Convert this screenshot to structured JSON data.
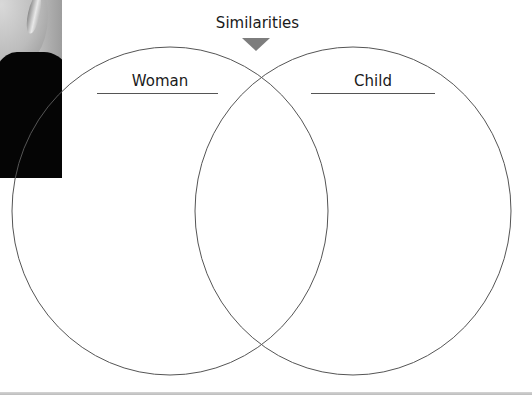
{
  "diagram": {
    "type": "venn",
    "title": "Similarities",
    "circles": [
      {
        "label": "Woman",
        "cx": 170,
        "cy": 211,
        "rx": 158,
        "ry": 164
      },
      {
        "label": "Child",
        "cx": 353,
        "cy": 211,
        "rx": 158,
        "ry": 164
      }
    ],
    "overlap_label": "Similarities",
    "colors": {
      "outline": "#555555",
      "arrow": "#7d7d7d",
      "text": "#1a1a1a",
      "photo_shirt": "#050505"
    }
  },
  "image": {
    "description": "cropped photo of a person (face and dark shirt) at top-left"
  }
}
